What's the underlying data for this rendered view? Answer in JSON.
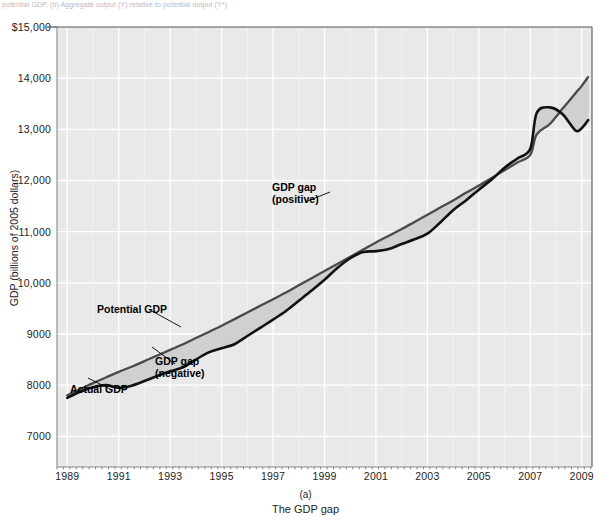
{
  "figure": {
    "cut_header_text": "potential GDP. (b) Aggregate output (Y) relative to potential output (Y*)",
    "panel_letter": "(a)",
    "caption": "The GDP gap"
  },
  "axes": {
    "y_title": "GDP (billions of 2005 dollars)",
    "y_ticks": [
      "$15,000",
      "14,000",
      "13,000",
      "12,000",
      "11,000",
      "10,000",
      "9000",
      "8000",
      "7000"
    ],
    "y_tick_values": [
      15000,
      14000,
      13000,
      12000,
      11000,
      10000,
      9000,
      8000,
      7000
    ],
    "x_ticks": [
      "1989",
      "1991",
      "1993",
      "1995",
      "1997",
      "1999",
      "2001",
      "2003",
      "2005",
      "2007",
      "2009"
    ],
    "x_tick_values": [
      1989,
      1991,
      1993,
      1995,
      1997,
      1999,
      2001,
      2003,
      2005,
      2007,
      2009
    ]
  },
  "annotations": {
    "potential_gdp": "Potential GDP",
    "actual_gdp": "Actual GDP",
    "gap_negative_line1": "GDP gap",
    "gap_negative_line2": "(negative)",
    "gap_positive_line1": "GDP gap",
    "gap_positive_line2": "(positive)"
  },
  "colors": {
    "plot_background": "#e9e9e9",
    "gridline": "#ffffff",
    "actual_gdp_line": "#111111",
    "potential_gdp_line": "#4a4a4a",
    "gap_fill": "#cfcfcf",
    "axis_frame": "#555555",
    "text": "#1d1d1d"
  },
  "chart_data": {
    "type": "line",
    "title": "The GDP gap",
    "xlabel": "",
    "ylabel": "GDP (billions of 2005 dollars)",
    "xlim": [
      1988.6,
      2009.4
    ],
    "ylim": [
      6400,
      15000
    ],
    "grid": true,
    "legend": "none (inline annotations)",
    "x": [
      1989.0,
      1989.5,
      1990.0,
      1990.5,
      1991.0,
      1991.5,
      1992.0,
      1992.5,
      1993.0,
      1993.5,
      1994.0,
      1994.5,
      1995.0,
      1995.5,
      1996.0,
      1996.5,
      1997.0,
      1997.5,
      1998.0,
      1998.5,
      1999.0,
      1999.5,
      2000.0,
      2000.5,
      2001.0,
      2001.5,
      2002.0,
      2002.5,
      2003.0,
      2003.5,
      2004.0,
      2004.5,
      2005.0,
      2005.5,
      2006.0,
      2006.5,
      2007.0,
      2007.25,
      2007.75,
      2008.25,
      2008.75,
      2009.0,
      2009.25
    ],
    "series": [
      {
        "name": "Actual GDP",
        "values": [
          7750,
          7870,
          7960,
          8000,
          7950,
          7990,
          8080,
          8180,
          8270,
          8350,
          8500,
          8640,
          8720,
          8800,
          8960,
          9120,
          9280,
          9450,
          9650,
          9850,
          10060,
          10290,
          10480,
          10600,
          10620,
          10660,
          10760,
          10850,
          10960,
          11180,
          11420,
          11610,
          11820,
          12020,
          12250,
          12430,
          12620,
          13320,
          13430,
          13300,
          12980,
          13020,
          13180
        ]
      },
      {
        "name": "Potential GDP",
        "values": [
          7800,
          7920,
          8040,
          8150,
          8260,
          8360,
          8470,
          8580,
          8690,
          8800,
          8920,
          9040,
          9160,
          9290,
          9420,
          9550,
          9680,
          9810,
          9950,
          10090,
          10230,
          10370,
          10510,
          10650,
          10790,
          10920,
          11050,
          11190,
          11330,
          11470,
          11610,
          11760,
          11900,
          12050,
          12200,
          12350,
          12500,
          12900,
          13100,
          13400,
          13700,
          13850,
          14020
        ]
      }
    ],
    "gap_regions": [
      {
        "label": "GDP gap (negative)",
        "span": [
          1989,
          1997
        ],
        "meaning": "actual GDP below potential GDP"
      },
      {
        "label": "GDP gap (positive)",
        "span": [
          1997,
          2001
        ],
        "meaning": "actual GDP above potential GDP"
      },
      {
        "label": "GDP gap (negative)",
        "span": [
          2001,
          2009
        ],
        "meaning": "actual GDP below potential GDP"
      }
    ]
  }
}
